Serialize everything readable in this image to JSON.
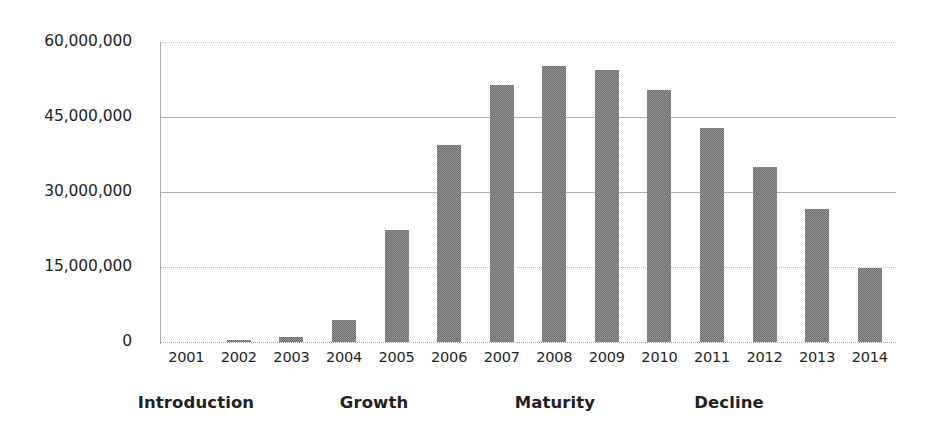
{
  "chart_data": {
    "type": "bar",
    "title": "",
    "subtitle": "",
    "xlabel": "",
    "ylabel": "",
    "categories": [
      "2001",
      "2002",
      "2003",
      "2004",
      "2005",
      "2006",
      "2007",
      "2008",
      "2009",
      "2010",
      "2011",
      "2012",
      "2013",
      "2014"
    ],
    "values": [
      0,
      400000,
      1000000,
      4500000,
      22500000,
      39500000,
      51500000,
      55300000,
      54500000,
      50500000,
      42800000,
      35000000,
      26600000,
      14800000
    ],
    "series": [
      {
        "name": "Sales",
        "values": [
          0,
          400000,
          1000000,
          4500000,
          22500000,
          39500000,
          51500000,
          55300000,
          54500000,
          50500000,
          42800000,
          35000000,
          26600000,
          14800000
        ]
      }
    ],
    "ylim": [
      0,
      60000000
    ],
    "ytick_values": [
      0,
      15000000,
      30000000,
      45000000,
      60000000
    ],
    "ytick_labels": [
      "0",
      "15,000,000",
      "30,000,000",
      "45,000,000",
      "60,000,000"
    ],
    "grid": true,
    "grid_axis": "y",
    "legend": false,
    "legend_position": "none",
    "bar_color": "#6b6b6b",
    "background_color": "#ffffff",
    "annotations": [
      {
        "label": "Introduction",
        "span": [
          "2001",
          "2003"
        ],
        "center_x_px": 196
      },
      {
        "label": "Growth",
        "span": [
          "2004",
          "2006"
        ],
        "center_x_px": 374
      },
      {
        "label": "Maturity",
        "span": [
          "2007",
          "2010"
        ],
        "center_x_px": 555
      },
      {
        "label": "Decline",
        "span": [
          "2011",
          "2014"
        ],
        "center_x_px": 729
      }
    ]
  },
  "axes": {
    "y_labels": [
      {
        "text": "60,000,000",
        "value": 60000000
      },
      {
        "text": "45,000,000",
        "value": 45000000
      },
      {
        "text": "30,000,000",
        "value": 30000000
      },
      {
        "text": "15,000,000",
        "value": 15000000
      },
      {
        "text": "0",
        "value": 0
      }
    ]
  },
  "stages": [
    {
      "label": "Introduction"
    },
    {
      "label": "Growth"
    },
    {
      "label": "Maturity"
    },
    {
      "label": "Decline"
    }
  ]
}
